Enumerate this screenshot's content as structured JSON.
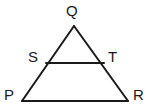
{
  "figure": {
    "name": "triangle-with-midsegment",
    "background_color": "#ffffff",
    "stroke_color": "#1a1a1a",
    "stroke_width": 2,
    "width": 148,
    "height": 112,
    "labels": {
      "apex": "Q",
      "left_mid": "S",
      "right_mid": "T",
      "bottom_left": "P",
      "bottom_right": "R"
    },
    "points": {
      "Q": {
        "x": 74,
        "y": 26
      },
      "S": {
        "x": 46,
        "y": 63
      },
      "T": {
        "x": 104,
        "y": 63
      },
      "P": {
        "x": 22,
        "y": 101
      },
      "R": {
        "x": 128,
        "y": 101
      }
    },
    "segments": [
      {
        "name": "QP",
        "from": "Q",
        "to": "P"
      },
      {
        "name": "QR",
        "from": "Q",
        "to": "R"
      },
      {
        "name": "PR",
        "from": "P",
        "to": "R"
      },
      {
        "name": "ST",
        "from": "S",
        "to": "T"
      }
    ]
  }
}
